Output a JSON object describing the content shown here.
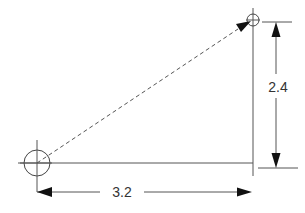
{
  "diagram": {
    "title": "",
    "dimensions": {
      "horizontal": {
        "label": "3.2"
      },
      "vertical": {
        "label": "2.4"
      }
    },
    "points": {
      "start": {
        "type": "large-circle-with-crosshair"
      },
      "end": {
        "type": "small-circle-with-crosshair"
      }
    },
    "vector": {
      "style": "dashed",
      "direction": "start-to-end"
    },
    "colors": {
      "line": "#444444",
      "arrowhead": "#111111",
      "text": "#333333",
      "background": "#ffffff"
    }
  }
}
